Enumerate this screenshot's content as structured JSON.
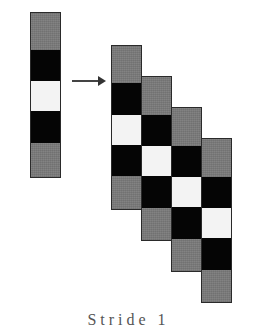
{
  "diagram": {
    "colors": {
      "gray": "#7b7b7b",
      "black": "#050505",
      "white": "#f3f3f3",
      "outline": "#2a2a2a"
    },
    "source_column": {
      "blocks": [
        "gray",
        "black",
        "white",
        "black",
        "gray"
      ]
    },
    "arrow": {
      "direction": "right"
    },
    "output_columns": [
      {
        "index": 1,
        "blocks": [
          "gray",
          "black",
          "white",
          "black",
          "gray"
        ]
      },
      {
        "index": 2,
        "blocks": [
          "gray",
          "black",
          "white",
          "black",
          "gray"
        ]
      },
      {
        "index": 3,
        "blocks": [
          "gray",
          "black",
          "white",
          "black",
          "gray"
        ]
      },
      {
        "index": 4,
        "blocks": [
          "gray",
          "black",
          "white",
          "black",
          "gray"
        ]
      }
    ],
    "caption": "Stride 1"
  }
}
